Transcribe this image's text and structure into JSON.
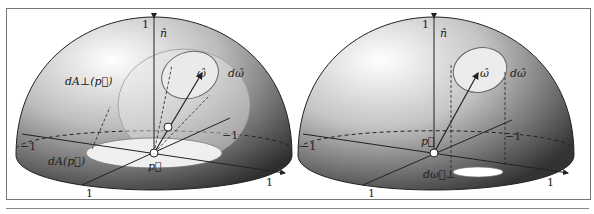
{
  "figure": {
    "left_panel": {
      "labels": {
        "top_tick": "1",
        "normal": "n̂",
        "omega": "ω̂",
        "d_omega": "dω̂",
        "dA_perp": "dA⊥(p⃗)",
        "dA": "dA(p⃗)",
        "point": "p⃗",
        "left_tick": "−1",
        "right_tick": "−1",
        "front_tick": "1",
        "right_front_tick": "1"
      }
    },
    "right_panel": {
      "labels": {
        "top_tick": "1",
        "normal": "n̂",
        "omega": "ω̂",
        "d_omega": "dω̂",
        "point": "p⃗",
        "d_omega_perp": "dω⃗⊥",
        "left_tick": "−1",
        "right_tick": "−1",
        "front_tick": "1",
        "right_front_tick": "1"
      }
    }
  }
}
